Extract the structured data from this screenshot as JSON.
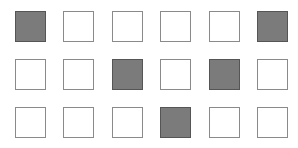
{
  "grid": {
    "rows": 3,
    "cols": 6,
    "colors": {
      "filled": "#7b7b7b",
      "filled_border": "#555555",
      "empty": "#ffffff",
      "empty_border": "#8a8a8a"
    },
    "cells": [
      [
        1,
        0,
        0,
        0,
        0,
        1
      ],
      [
        0,
        0,
        1,
        0,
        1,
        0
      ],
      [
        0,
        0,
        0,
        1,
        0,
        0
      ]
    ]
  }
}
